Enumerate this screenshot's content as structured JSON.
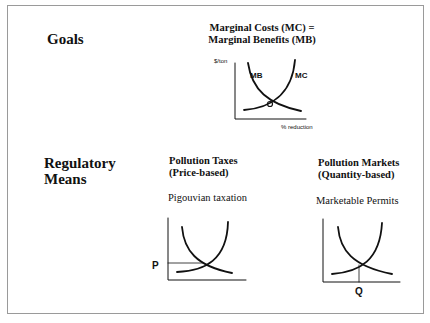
{
  "goals": {
    "label": "Goals",
    "title_line1": "Marginal Costs (MC) =",
    "title_line2": "Marginal Benefits (MB)",
    "chart": {
      "y_axis_label": "$/ton",
      "x_axis_label": "% reduction",
      "curve_mb_label": "MB",
      "curve_mc_label": "MC"
    }
  },
  "regulatory": {
    "label_line1": "Regulatory",
    "label_line2": "Means",
    "taxes": {
      "title_line1": "Pollution Taxes",
      "title_line2": "(Price-based)",
      "subtitle": "Pigouvian taxation",
      "price_label": "P"
    },
    "markets": {
      "title_line1": "Pollution Markets",
      "title_line2": "(Quantity-based)",
      "subtitle": "Marketable Permits",
      "quantity_label": "Q"
    }
  },
  "colors": {
    "ink": "#111111",
    "frame": "#9a9a9a",
    "background": "#ffffff"
  }
}
